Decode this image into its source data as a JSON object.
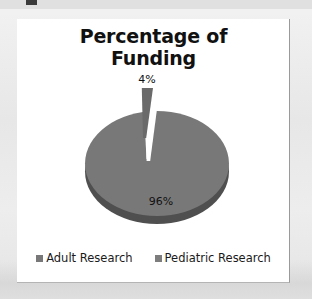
{
  "chart_data": {
    "type": "pie",
    "title": "Percentage of Funding",
    "title_lines": [
      "Percentage of",
      "Funding"
    ],
    "categories": [
      "Adult Research",
      "Pediatric Research"
    ],
    "values": [
      96,
      4
    ],
    "data_labels": [
      "96%",
      "4%"
    ],
    "legend_position": "bottom",
    "grid": false,
    "xlabel": "",
    "ylabel": "",
    "style": "3d-exploded-pie",
    "colors": {
      "adult_research": "#787878",
      "pediatric_research": "#6a6a6a",
      "pie_depth": "#4f4f4f",
      "title_text": "#111111",
      "label_text": "#111111",
      "chart_background": "#ffffff",
      "page_background": "#e9e9e9"
    }
  },
  "chart": {
    "title": {
      "line1": "Percentage of",
      "line2": "Funding"
    },
    "labels": {
      "small_slice": "4%",
      "large_slice": "96%"
    },
    "legend": [
      {
        "label": "Adult Research",
        "color": "#787878"
      },
      {
        "label": "Pediatric Research",
        "color": "#7d7d7d"
      }
    ]
  }
}
